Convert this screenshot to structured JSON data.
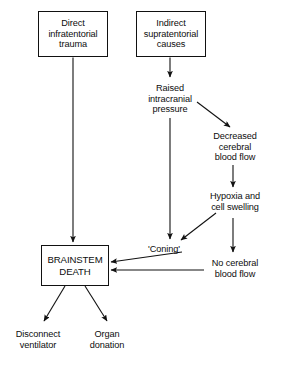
{
  "diagram": {
    "background_color": "#ffffff",
    "line_color": "#111111",
    "text_color": "#0d0d0d",
    "nodes": {
      "direct_trauma": "Direct\ninfratentorial\ntrauma",
      "indirect_causes": "Indirect\nsupratentorial\ncauses",
      "raised_icp": "Raised\nintracranial\npressure",
      "decreased_flow": "Decreased\ncerebral\nblood flow",
      "hypoxia": "Hypoxia and\ncell swelling",
      "coning": "'Coning'",
      "no_flow": "No cerebral\nblood flow",
      "brainstem_death": "BRAINSTEM\nDEATH",
      "disconnect_ventilator": "Disconnect\nventilator",
      "organ_donation": "Organ\ndonation"
    }
  }
}
